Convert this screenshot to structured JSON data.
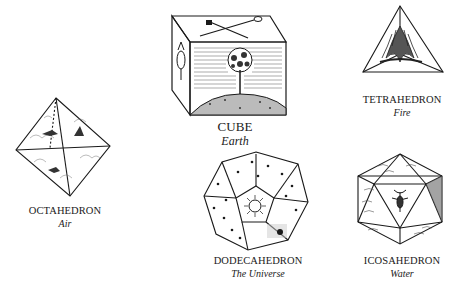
{
  "figure": {
    "solids": [
      {
        "id": "cube",
        "name": "CUBE",
        "element": "Earth"
      },
      {
        "id": "tetrahedron",
        "name": "TETRAHEDRON",
        "element": "Fire"
      },
      {
        "id": "octahedron",
        "name": "OCTAHEDRON",
        "element": "Air"
      },
      {
        "id": "dodecahedron",
        "name": "DODECAHEDRON",
        "element": "The Universe"
      },
      {
        "id": "icosahedron",
        "name": "ICOSAHEDRON",
        "element": "Water"
      }
    ],
    "colors": {
      "ink": "#1a1a1a",
      "background": "#ffffff"
    }
  }
}
